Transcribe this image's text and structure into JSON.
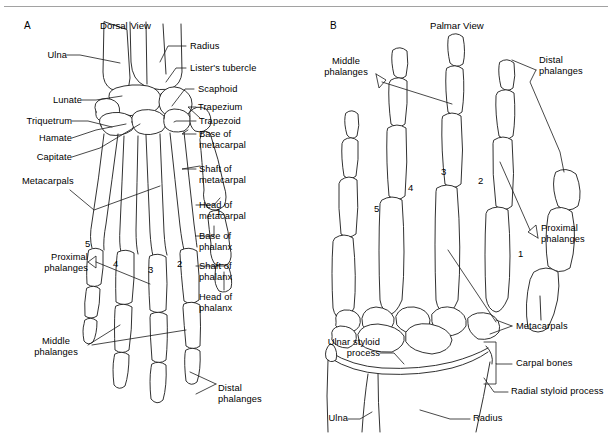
{
  "figure": {
    "panels": [
      {
        "letter": "A",
        "title": "Dorsal View",
        "labels": [
          "Ulna",
          "Radius",
          "Lister's tubercle",
          "Lunate",
          "Scaphoid",
          "Trapezium",
          "Triquetrum",
          "Trapezoid",
          "Hamate",
          "Base of\nmetacarpal",
          "Capitate",
          "Shaft of\nmetacarpal",
          "Metacarpals",
          "Head of\nmetacarpal",
          "Base of\nphalanx",
          "Proximal\nphalanges",
          "Shaft of\nphalanx",
          "Head of\nphalanx",
          "Middle\nphalanges",
          "Distal\nphalanges"
        ],
        "digits": [
          "1",
          "2",
          "3",
          "4",
          "5"
        ]
      },
      {
        "letter": "B",
        "title": "Palmar View",
        "labels": [
          "Middle\nphalanges",
          "Distal\nphalanges",
          "Proximal\nphalanges",
          "Metacarpals",
          "Ulnar styloid\nprocess",
          "Carpal bones",
          "Radial styloid process",
          "Ulna",
          "Radius"
        ],
        "digits": [
          "1",
          "2",
          "3",
          "4",
          "5"
        ]
      }
    ],
    "panel_a": {
      "letter": "A",
      "title": "Dorsal View",
      "ulna": "Ulna",
      "radius": "Radius",
      "listers_tubercle": "Lister's tubercle",
      "lunate": "Lunate",
      "scaphoid": "Scaphoid",
      "trapezium": "Trapezium",
      "triquetrum": "Triquetrum",
      "trapezoid": "Trapezoid",
      "hamate": "Hamate",
      "base_of_metacarpal": "Base of\nmetacarpal",
      "capitate": "Capitate",
      "shaft_of_metacarpal": "Shaft of\nmetacarpal",
      "metacarpals": "Metacarpals",
      "head_of_metacarpal": "Head of\nmetacarpal",
      "base_of_phalanx": "Base of\nphalanx",
      "proximal_phalanges": "Proximal\nphalanges",
      "shaft_of_phalanx": "Shaft of\nphalanx",
      "head_of_phalanx": "Head of\nphalanx",
      "middle_phalanges": "Middle\nphalanges",
      "distal_phalanges": "Distal\nphalanges",
      "digit_1": "1",
      "digit_2": "2",
      "digit_3": "3",
      "digit_4": "4",
      "digit_5": "5"
    },
    "panel_b": {
      "letter": "B",
      "title": "Palmar View",
      "middle_phalanges": "Middle\nphalanges",
      "distal_phalanges": "Distal\nphalanges",
      "proximal_phalanges": "Proximal\nphalanges",
      "metacarpals": "Metacarpals",
      "ulnar_styloid_process": "Ulnar styloid\nprocess",
      "carpal_bones": "Carpal bones",
      "radial_styloid_process": "Radial styloid process",
      "ulna": "Ulna",
      "radius": "Radius",
      "digit_1": "1",
      "digit_2": "2",
      "digit_3": "3",
      "digit_4": "4",
      "digit_5": "5"
    },
    "colors": {
      "ink": "#1a1a1a",
      "background": "#ffffff",
      "rule": "#8a8a8a"
    }
  }
}
